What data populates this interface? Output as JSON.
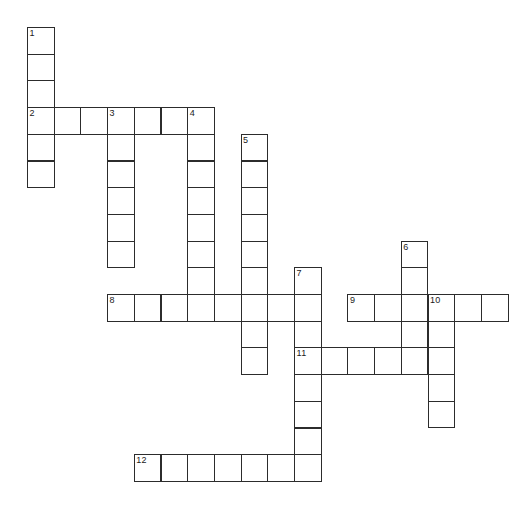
{
  "page": {
    "background_color": "#ffffff",
    "width": 520,
    "height": 523
  },
  "grid": {
    "origin_x": 27,
    "origin_y": 27,
    "cell_size": 26.7,
    "cell_border_color": "#2c2c2c",
    "cell_fill_color": "#ffffff",
    "number_color": "#1a1a1a",
    "columns": 18,
    "rows": 17
  },
  "footer": {
    "note": "",
    "color": "#d8d8d8"
  },
  "entries": [
    {
      "number": "1",
      "direction": "down",
      "col": 0,
      "row": 0,
      "length": 6,
      "label": "1-down"
    },
    {
      "number": "2",
      "direction": "across",
      "col": 0,
      "row": 3,
      "length": 7,
      "label": "2-across"
    },
    {
      "number": "3",
      "direction": "down",
      "col": 3,
      "row": 3,
      "length": 6,
      "label": "3-down"
    },
    {
      "number": "4",
      "direction": "down",
      "col": 6,
      "row": 3,
      "length": 8,
      "label": "4-down"
    },
    {
      "number": "5",
      "direction": "down",
      "col": 8,
      "row": 4,
      "length": 9,
      "label": "5-down"
    },
    {
      "number": "6",
      "direction": "down",
      "col": 14,
      "row": 8,
      "length": 5,
      "label": "6-down"
    },
    {
      "number": "7",
      "direction": "down",
      "col": 10,
      "row": 9,
      "length": 8,
      "label": "7-down"
    },
    {
      "number": "8",
      "direction": "across",
      "col": 3,
      "row": 10,
      "length": 8,
      "label": "8-across"
    },
    {
      "number": "9",
      "direction": "across",
      "col": 12,
      "row": 10,
      "length": 6,
      "label": "9-across"
    },
    {
      "number": "10",
      "direction": "down",
      "col": 15,
      "row": 10,
      "length": 6,
      "label": "10-down"
    },
    {
      "number": "11",
      "direction": "across",
      "col": 10,
      "row": 12,
      "length": 6,
      "label": "11-across"
    },
    {
      "number": "12",
      "direction": "across",
      "col": 4,
      "row": 16,
      "length": 7,
      "label": "12-across"
    }
  ],
  "cells": [
    {
      "col": 0,
      "row": 0,
      "number": "1"
    },
    {
      "col": 0,
      "row": 1,
      "number": ""
    },
    {
      "col": 0,
      "row": 2,
      "number": ""
    },
    {
      "col": 0,
      "row": 3,
      "number": "2"
    },
    {
      "col": 1,
      "row": 3,
      "number": ""
    },
    {
      "col": 2,
      "row": 3,
      "number": ""
    },
    {
      "col": 3,
      "row": 3,
      "number": "3"
    },
    {
      "col": 4,
      "row": 3,
      "number": ""
    },
    {
      "col": 5,
      "row": 3,
      "number": ""
    },
    {
      "col": 6,
      "row": 3,
      "number": "4"
    },
    {
      "col": 0,
      "row": 4,
      "number": ""
    },
    {
      "col": 0,
      "row": 5,
      "number": ""
    },
    {
      "col": 3,
      "row": 4,
      "number": ""
    },
    {
      "col": 3,
      "row": 5,
      "number": ""
    },
    {
      "col": 3,
      "row": 6,
      "number": ""
    },
    {
      "col": 3,
      "row": 7,
      "number": ""
    },
    {
      "col": 3,
      "row": 8,
      "number": ""
    },
    {
      "col": 6,
      "row": 4,
      "number": ""
    },
    {
      "col": 6,
      "row": 5,
      "number": ""
    },
    {
      "col": 6,
      "row": 6,
      "number": ""
    },
    {
      "col": 6,
      "row": 7,
      "number": ""
    },
    {
      "col": 6,
      "row": 8,
      "number": ""
    },
    {
      "col": 6,
      "row": 9,
      "number": ""
    },
    {
      "col": 6,
      "row": 10,
      "number": ""
    },
    {
      "col": 8,
      "row": 4,
      "number": "5"
    },
    {
      "col": 8,
      "row": 5,
      "number": ""
    },
    {
      "col": 8,
      "row": 6,
      "number": ""
    },
    {
      "col": 8,
      "row": 7,
      "number": ""
    },
    {
      "col": 8,
      "row": 8,
      "number": ""
    },
    {
      "col": 8,
      "row": 9,
      "number": ""
    },
    {
      "col": 8,
      "row": 10,
      "number": ""
    },
    {
      "col": 8,
      "row": 11,
      "number": ""
    },
    {
      "col": 8,
      "row": 12,
      "number": ""
    },
    {
      "col": 14,
      "row": 8,
      "number": "6"
    },
    {
      "col": 14,
      "row": 9,
      "number": ""
    },
    {
      "col": 14,
      "row": 10,
      "number": ""
    },
    {
      "col": 14,
      "row": 11,
      "number": ""
    },
    {
      "col": 14,
      "row": 12,
      "number": ""
    },
    {
      "col": 10,
      "row": 9,
      "number": "7"
    },
    {
      "col": 10,
      "row": 10,
      "number": ""
    },
    {
      "col": 10,
      "row": 11,
      "number": ""
    },
    {
      "col": 10,
      "row": 12,
      "number": "11"
    },
    {
      "col": 10,
      "row": 13,
      "number": ""
    },
    {
      "col": 10,
      "row": 14,
      "number": ""
    },
    {
      "col": 10,
      "row": 15,
      "number": ""
    },
    {
      "col": 10,
      "row": 16,
      "number": ""
    },
    {
      "col": 3,
      "row": 10,
      "number": "8"
    },
    {
      "col": 4,
      "row": 10,
      "number": ""
    },
    {
      "col": 5,
      "row": 10,
      "number": ""
    },
    {
      "col": 7,
      "row": 10,
      "number": ""
    },
    {
      "col": 9,
      "row": 10,
      "number": ""
    },
    {
      "col": 12,
      "row": 10,
      "number": "9"
    },
    {
      "col": 13,
      "row": 10,
      "number": ""
    },
    {
      "col": 15,
      "row": 10,
      "number": "10"
    },
    {
      "col": 16,
      "row": 10,
      "number": ""
    },
    {
      "col": 17,
      "row": 10,
      "number": ""
    },
    {
      "col": 15,
      "row": 11,
      "number": ""
    },
    {
      "col": 15,
      "row": 12,
      "number": ""
    },
    {
      "col": 15,
      "row": 13,
      "number": ""
    },
    {
      "col": 15,
      "row": 14,
      "number": ""
    },
    {
      "col": 11,
      "row": 12,
      "number": ""
    },
    {
      "col": 12,
      "row": 12,
      "number": ""
    },
    {
      "col": 13,
      "row": 12,
      "number": ""
    },
    {
      "col": 4,
      "row": 16,
      "number": "12"
    },
    {
      "col": 5,
      "row": 16,
      "number": ""
    },
    {
      "col": 6,
      "row": 16,
      "number": ""
    },
    {
      "col": 7,
      "row": 16,
      "number": ""
    },
    {
      "col": 8,
      "row": 16,
      "number": ""
    },
    {
      "col": 9,
      "row": 16,
      "number": ""
    }
  ]
}
